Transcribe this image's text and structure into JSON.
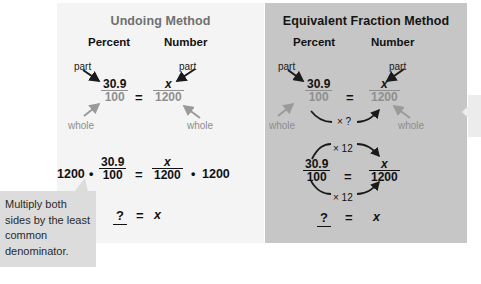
{
  "figure": {
    "left_panel": {
      "title": "Undoing Method",
      "columns": {
        "percent": "Percent",
        "number": "Number"
      },
      "labels": {
        "part_left": "part",
        "part_right": "part",
        "whole_left": "whole",
        "whole_right": "whole"
      },
      "equation1": {
        "left_fraction": {
          "numerator": "30.9",
          "denominator": "100"
        },
        "equals": "=",
        "right_fraction": {
          "numerator": "x",
          "denominator": "1200"
        }
      },
      "equation2": {
        "left_multiplier": "1200",
        "dot1": "•",
        "left_fraction": {
          "numerator": "30.9",
          "denominator": "100"
        },
        "equals": "=",
        "right_fraction": {
          "numerator": "x",
          "denominator": "1200"
        },
        "dot2": "•",
        "right_multiplier": "1200"
      },
      "equation3": {
        "blank": "?",
        "equals": "=",
        "variable": "x"
      }
    },
    "right_panel": {
      "title": "Equivalent Fraction Method",
      "columns": {
        "percent": "Percent",
        "number": "Number"
      },
      "labels": {
        "part_left": "part",
        "part_right": "part",
        "whole_left": "whole",
        "whole_right": "whole"
      },
      "equation1": {
        "left_fraction": {
          "numerator": "30.9",
          "denominator": "100"
        },
        "equals": "=",
        "right_fraction": {
          "numerator": "x",
          "denominator": "1200"
        },
        "arrow_label": "× ?"
      },
      "equation2": {
        "left_fraction": {
          "numerator": "30.9",
          "denominator": "100"
        },
        "equals": "=",
        "right_fraction": {
          "numerator": "x",
          "denominator": "1200"
        },
        "arrow_label_top": "× 12",
        "arrow_label_bottom": "× 12"
      },
      "equation3": {
        "blank": "?",
        "equals": "=",
        "variable": "x"
      }
    },
    "callout": {
      "text": "Multiply both sides by the least common denominator."
    },
    "colors": {
      "panel_left_bg": "#f4f4f4",
      "panel_right_bg": "#c6c6c6",
      "callout_bg": "#dcdcdc",
      "title_left": "#6f6f6f",
      "title_right": "#141414",
      "part_label": "#1a1a1a",
      "whole_label": "#8d8d8d",
      "arrow_dark": "#1a1a1a",
      "arrow_gray": "#9a9a9a"
    }
  }
}
